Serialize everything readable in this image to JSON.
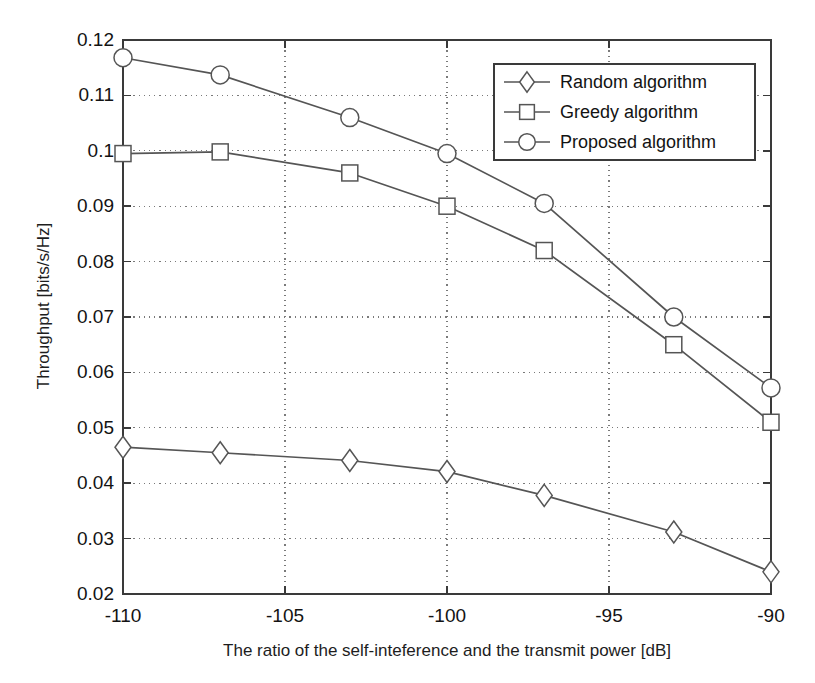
{
  "chart_data": {
    "type": "line",
    "title": "",
    "xlabel": "The ratio of the self-inteference and the transmit power [dB]",
    "ylabel": "Throughput [bits/s/Hz]",
    "x": [
      -110,
      -107,
      -103,
      -100,
      -97,
      -93,
      -90
    ],
    "xlim": [
      -110,
      -90
    ],
    "ylim": [
      0.02,
      0.12
    ],
    "xticks": [
      -110,
      -105,
      -100,
      -95,
      -90
    ],
    "xtick_labels": [
      "-110",
      "-105",
      "-100",
      "-95",
      "-90"
    ],
    "yticks": [
      0.02,
      0.03,
      0.04,
      0.05,
      0.06,
      0.07,
      0.08,
      0.09,
      0.1,
      0.11,
      0.12
    ],
    "ytick_labels": [
      "0.02",
      "0.03",
      "0.04",
      "0.05",
      "0.06",
      "0.07",
      "0.08",
      "0.09",
      "0.1",
      "0.11",
      "0.12"
    ],
    "grid": true,
    "grid_style": "dotted",
    "legend_position": "top-right",
    "line_color": "#555555",
    "series": [
      {
        "name": "Random algorithm",
        "marker": "diamond",
        "values": [
          0.0465,
          0.0455,
          0.0441,
          0.0421,
          0.0378,
          0.0312,
          0.024
        ]
      },
      {
        "name": "Greedy algorithm",
        "marker": "square",
        "values": [
          0.0995,
          0.0998,
          0.096,
          0.09,
          0.082,
          0.065,
          0.051
        ]
      },
      {
        "name": "Proposed algorithm",
        "marker": "circle",
        "values": [
          0.1168,
          0.1137,
          0.106,
          0.0995,
          0.0905,
          0.07,
          0.0572
        ]
      }
    ]
  },
  "legend": {
    "items": [
      {
        "label": "Random algorithm",
        "marker": "diamond"
      },
      {
        "label": "Greedy algorithm",
        "marker": "square"
      },
      {
        "label": "Proposed algorithm",
        "marker": "circle"
      }
    ]
  },
  "axes": {
    "x_title": "The ratio of the self-inteference and the transmit power [dB]",
    "y_title": "Throughput [bits/s/Hz]"
  }
}
